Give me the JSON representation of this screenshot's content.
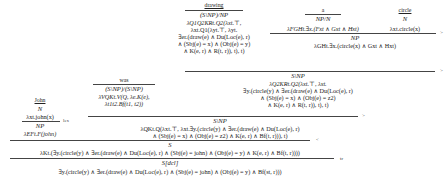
{
  "lexicon": {
    "drawing": {
      "word": "drawing",
      "category": "(S\\NP)/NP",
      "semantics": [
        "λQ1Q2KRt.Q2(λxt.⊤,",
        "λxt.Q1(λyt.⊤, λyt.",
        "∃er.(draw(e) ∧ Du(Loc(e), r)",
        "∧ (Sbj(e) = x) ∧ (Obj(e) = y)",
        "∧ K(e, r) ∧ R(t, r)), t), t)"
      ]
    },
    "a": {
      "word": "a",
      "category": "NP/N",
      "semantics": [
        "λFGHt.∃x.(Fxt ∧ Gxt ∧ Hxt)"
      ]
    },
    "circle": {
      "word": "circle",
      "category": "N",
      "semantics": [
        "λxt.circle(x)"
      ]
    },
    "was": {
      "word": "was",
      "category": "(S\\NP)/(S\\NP)",
      "semantics": [
        "λVQKt.V(Q, λe.K(e),",
        "λt1t2.Bf(t1, t2))"
      ]
    },
    "john": {
      "word": "John",
      "category": "N",
      "semantics": [
        "λxt.john(x)"
      ]
    }
  },
  "derivation": {
    "a_circle": {
      "category": "NP",
      "semantics": [
        "λGHt.∃x.(circle(x) ∧ Gxt ∧ Hxt)"
      ],
      "rule": ">"
    },
    "drawing_a_circle": {
      "category": "S\\NP",
      "semantics": [
        "λQ2KRt.Q2(λxt.⊤, λxt.",
        "∃y.(circle(y) ∧ ∃er.(draw(e) ∧ Du(Loc(e), r)",
        "∧ (Sbj(e) = x) ∧ (Obj(e) = z2)",
        "∧ K(e, r) ∧ R(t, r)), t), t)"
      ],
      "rule": ">"
    },
    "john_np": {
      "category": "NP",
      "semantics": [
        "λEFt.F(john)"
      ],
      "rule": "lex"
    },
    "was_vp": {
      "category": "S\\NP",
      "semantics": [
        "λQKt.Q(λxt.⊤, λxt.∃y.(circle(y) ∧ ∃er.(draw(e) ∧ Du(Loc(e), r)",
        "∧ (Sbj(e) = x) ∧ (Obj(e) = z2) ∧ K(e, r) ∧ Bf(t, r))), t)"
      ],
      "rule": ">"
    },
    "sentence": {
      "category": "S",
      "semantics": [
        "λKt.(∃y.(circle(y) ∧ ∃er.(draw(e) ∧ Du(Loc(e), r) ∧ (Sbj(e) = john) ∧ (Obj(e) = y) ∧ K(e, r) ∧ Bf(t, r))))"
      ],
      "rule": "<"
    },
    "final": {
      "category": "S[dcl]",
      "semantics": [
        "∃y.(circle(y) ∧ ∃er.(draw(e) ∧ Du(Loc(e), r) ∧ (Sbj(e) = john) ∧ (Obj(e) = y) ∧ Bf(st, r)))"
      ],
      "rule": "tr"
    }
  }
}
